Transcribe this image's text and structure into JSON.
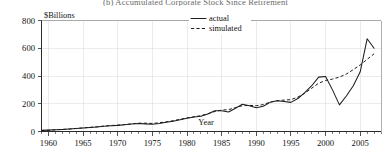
{
  "chart_data": {
    "type": "line",
    "title": "(b)  Accumulated Corporate Stock Since Retirement",
    "unit_label": "$Billions",
    "xlabel": "Year",
    "ylabel": "",
    "xlim": [
      1959,
      2008
    ],
    "ylim": [
      0,
      800
    ],
    "grid": true,
    "legend_position": "top-center",
    "x_major_ticks": [
      1960,
      1965,
      1970,
      1975,
      1980,
      1985,
      1990,
      1995,
      2000,
      2005
    ],
    "x_tick_labels": [
      "1960",
      "1965",
      "1970",
      "1975",
      "1980",
      "1985",
      "1990",
      "1995",
      "2000",
      "2005"
    ],
    "x_minor_tick_step": 1,
    "y_ticks": [
      0,
      200,
      400,
      600,
      800
    ],
    "y_tick_labels": [
      "0",
      "200",
      "400",
      "600",
      "800"
    ],
    "x": [
      1959,
      1960,
      1961,
      1962,
      1963,
      1964,
      1965,
      1966,
      1967,
      1968,
      1969,
      1970,
      1971,
      1972,
      1973,
      1974,
      1975,
      1976,
      1977,
      1978,
      1979,
      1980,
      1981,
      1982,
      1983,
      1984,
      1985,
      1986,
      1987,
      1988,
      1989,
      1990,
      1991,
      1992,
      1993,
      1994,
      1995,
      1996,
      1997,
      1998,
      1999,
      2000,
      2001,
      2002,
      2003,
      2004,
      2005,
      2006,
      2007
    ],
    "series": [
      {
        "name": "actual",
        "style": "solid",
        "values": [
          8,
          10,
          13,
          15,
          18,
          21,
          25,
          29,
          33,
          38,
          42,
          44,
          48,
          54,
          58,
          55,
          52,
          58,
          66,
          74,
          84,
          96,
          104,
          110,
          126,
          150,
          150,
          140,
          168,
          196,
          186,
          172,
          182,
          210,
          222,
          216,
          210,
          238,
          280,
          330,
          392,
          396,
          300,
          192,
          256,
          330,
          430,
          668,
          600
        ]
      },
      {
        "name": "simulated",
        "style": "dashed",
        "values": [
          7,
          9,
          12,
          15,
          18,
          22,
          26,
          30,
          34,
          39,
          43,
          46,
          50,
          55,
          60,
          60,
          58,
          63,
          70,
          78,
          88,
          98,
          106,
          114,
          128,
          144,
          154,
          158,
          172,
          186,
          188,
          186,
          194,
          212,
          222,
          226,
          230,
          248,
          276,
          312,
          348,
          368,
          378,
          392,
          414,
          446,
          480,
          520,
          560
        ]
      }
    ],
    "legend": [
      {
        "label": "actual",
        "style": "solid"
      },
      {
        "label": "simulated",
        "style": "dashed"
      }
    ]
  }
}
